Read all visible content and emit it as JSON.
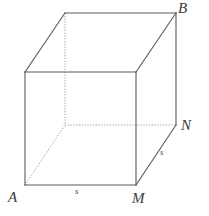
{
  "figure": {
    "kind": "geometry-diagram",
    "shape": "cube",
    "background_color": "#ffffff",
    "solid_edge_color": "#5a5a5a",
    "hidden_edge_color": "#9a9a9a",
    "label_color": "#3b3b3b",
    "labels": {
      "vertex_b": "B",
      "vertex_n": "N",
      "vertex_m": "M",
      "vertex_a": "A",
      "edge_bottom_front": "s",
      "edge_right_depth": "s"
    },
    "geometry": {
      "front_face": {
        "top_left": [
          25,
          72
        ],
        "top_right": [
          136,
          72
        ],
        "bottom_right": [
          136,
          185
        ],
        "bottom_left": [
          25,
          185
        ]
      },
      "back_face": {
        "top_left": [
          65,
          13
        ],
        "top_right": [
          176,
          13
        ],
        "bottom_right": [
          176,
          125
        ],
        "bottom_left": [
          65,
          125
        ]
      },
      "depth_offset": [
        40,
        -59
      ],
      "solid_edges": [
        [
          [
            25,
            72
          ],
          [
            136,
            72
          ]
        ],
        [
          [
            136,
            72
          ],
          [
            136,
            185
          ]
        ],
        [
          [
            136,
            185
          ],
          [
            25,
            185
          ]
        ],
        [
          [
            25,
            185
          ],
          [
            25,
            72
          ]
        ],
        [
          [
            25,
            72
          ],
          [
            65,
            13
          ]
        ],
        [
          [
            136,
            72
          ],
          [
            176,
            13
          ]
        ],
        [
          [
            65,
            13
          ],
          [
            176,
            13
          ]
        ],
        [
          [
            176,
            13
          ],
          [
            176,
            125
          ]
        ],
        [
          [
            136,
            185
          ],
          [
            176,
            125
          ]
        ]
      ],
      "hidden_edges": [
        [
          [
            65,
            13
          ],
          [
            65,
            125
          ]
        ],
        [
          [
            65,
            125
          ],
          [
            176,
            125
          ]
        ],
        [
          [
            25,
            185
          ],
          [
            65,
            125
          ]
        ]
      ]
    }
  }
}
